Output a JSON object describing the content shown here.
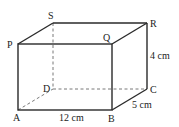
{
  "figure": {
    "type": "cuboid",
    "colors": {
      "stroke": "#2a2a2a",
      "text": "#222222",
      "background": "#ffffff"
    },
    "vertices": {
      "P": "P",
      "Q": "Q",
      "R": "R",
      "S": "S",
      "A": "A",
      "B": "B",
      "C": "C",
      "D": "D"
    },
    "dimensions": {
      "length": "12 cm",
      "width": "5 cm",
      "height": "4 cm"
    }
  }
}
